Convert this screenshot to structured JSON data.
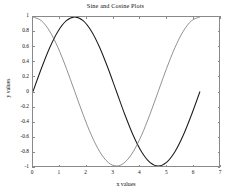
{
  "chart_data": {
    "type": "line",
    "title": "Sine and Cosine Plots",
    "xlabel": "x values",
    "ylabel": "y values",
    "xlim": [
      0,
      7
    ],
    "ylim": [
      -1,
      1
    ],
    "grid": false,
    "legend": "none",
    "xticks": [
      "0",
      "1",
      "2",
      "3",
      "4",
      "5",
      "6",
      "7"
    ],
    "xtick_values": [
      0,
      1,
      2,
      3,
      4,
      5,
      6,
      7
    ],
    "yticks": [
      "1",
      "0.8",
      "0.6",
      "0.4",
      "0.2",
      "0",
      "-0.2",
      "-0.4",
      "-0.6",
      "-0.8",
      "-1"
    ],
    "ytick_values": [
      1,
      0.8,
      0.6,
      0.4,
      0.2,
      0,
      -0.2,
      -0.4,
      -0.6,
      -0.8,
      -1
    ],
    "x_domain": [
      0,
      6.2832
    ],
    "series": [
      {
        "name": "sin(x)",
        "color": "#1a1a1a",
        "x": [
          0,
          0.3142,
          0.6283,
          0.9425,
          1.2566,
          1.5708,
          1.885,
          2.1991,
          2.5133,
          2.8274,
          3.1416,
          3.4558,
          3.7699,
          4.0841,
          4.3982,
          4.7124,
          5.0265,
          5.3407,
          5.6549,
          5.969,
          6.2832
        ],
        "y": [
          0,
          0.309,
          0.5878,
          0.809,
          0.9511,
          1,
          0.9511,
          0.809,
          0.5878,
          0.309,
          0,
          -0.309,
          -0.5878,
          -0.809,
          -0.9511,
          -1,
          -0.9511,
          -0.809,
          -0.5878,
          -0.309,
          0
        ]
      },
      {
        "name": "cos(x)",
        "color": "#6e6e6e",
        "x": [
          0,
          0.3142,
          0.6283,
          0.9425,
          1.2566,
          1.5708,
          1.885,
          2.1991,
          2.5133,
          2.8274,
          3.1416,
          3.4558,
          3.7699,
          4.0841,
          4.3982,
          4.7124,
          5.0265,
          5.3407,
          5.6549,
          5.969,
          6.2832
        ],
        "y": [
          1,
          0.9511,
          0.809,
          0.5878,
          0.309,
          0,
          -0.309,
          -0.5878,
          -0.809,
          -0.9511,
          -1,
          -0.9511,
          -0.809,
          -0.5878,
          -0.309,
          0,
          0.309,
          0.5878,
          0.809,
          0.9511,
          1
        ]
      }
    ],
    "annotations": []
  },
  "figure": {
    "background": "#ffffff",
    "axis_color": "#8a8a8a",
    "text_color": "#111111"
  }
}
